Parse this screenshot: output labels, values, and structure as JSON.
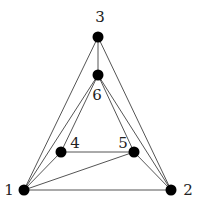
{
  "graph": {
    "nodes": [
      {
        "id": "1",
        "label": "1",
        "x": 24,
        "y": 190,
        "label_x": 9,
        "label_y": 190
      },
      {
        "id": "2",
        "label": "2",
        "x": 171,
        "y": 190,
        "label_x": 188,
        "label_y": 190
      },
      {
        "id": "3",
        "label": "3",
        "x": 98,
        "y": 37,
        "label_x": 100,
        "label_y": 17
      },
      {
        "id": "4",
        "label": "4",
        "x": 61,
        "y": 152,
        "label_x": 75,
        "label_y": 143
      },
      {
        "id": "5",
        "label": "5",
        "x": 134,
        "y": 152,
        "label_x": 123,
        "label_y": 143
      },
      {
        "id": "6",
        "label": "6",
        "x": 98,
        "y": 75,
        "label_x": 97,
        "label_y": 95
      }
    ],
    "edges": [
      [
        "1",
        "2"
      ],
      [
        "1",
        "3"
      ],
      [
        "1",
        "4"
      ],
      [
        "1",
        "5"
      ],
      [
        "1",
        "6"
      ],
      [
        "2",
        "3"
      ],
      [
        "2",
        "5"
      ],
      [
        "2",
        "6"
      ],
      [
        "3",
        "6"
      ],
      [
        "4",
        "5"
      ],
      [
        "4",
        "6"
      ],
      [
        "5",
        "6"
      ]
    ],
    "node_radius": 5.5,
    "colors": {
      "node": "#000000",
      "edge": "#555555",
      "label": "#222222",
      "background": "#ffffff"
    }
  }
}
